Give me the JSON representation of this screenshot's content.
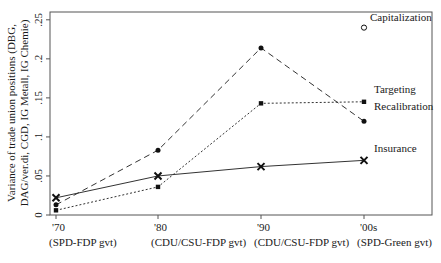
{
  "chart_data": {
    "type": "line",
    "title": "",
    "xlabel": "",
    "ylabel_lines": [
      "Variance of trade union positions (DBG,",
      "DAG/ver.di, CGD, IG Metall, IG Chemie)"
    ],
    "categories": [
      "'70",
      "'80",
      "'90",
      "'00s"
    ],
    "category_sublabels": [
      "(SPD-FDP gvt)",
      "(CDU/CSU-FDP gvt)",
      "(CDU/CSU-FDP gvt)",
      "(SPD-Green gvt)"
    ],
    "ylim": [
      0,
      0.26
    ],
    "yticks": [
      0,
      0.05,
      0.1,
      0.15,
      0.2,
      0.25
    ],
    "ytick_labels": [
      "0",
      ".05",
      ".1",
      ".15",
      ".2",
      ".25"
    ],
    "grid": false,
    "legend": "inline labels at right end of each series",
    "series": [
      {
        "name": "Insurance",
        "label": "Insurance",
        "values": [
          0.022,
          0.05,
          0.062,
          0.07
        ],
        "line": "solid",
        "marker": "x",
        "color": "#333333"
      },
      {
        "name": "Recalibration",
        "label": "Recalibration",
        "values": [
          0.013,
          0.083,
          0.214,
          0.12
        ],
        "line": "dashed",
        "marker": "dot",
        "color": "#333333"
      },
      {
        "name": "Targeting",
        "label": "Targeting",
        "values": [
          0.006,
          0.036,
          0.143,
          0.145
        ],
        "line": "dotted",
        "marker": "square",
        "color": "#333333"
      },
      {
        "name": "Capitalization",
        "label": "Capitalization",
        "values": [
          null,
          null,
          null,
          0.24
        ],
        "line": "none",
        "marker": "hollow-circle",
        "color": "#333333"
      }
    ]
  }
}
